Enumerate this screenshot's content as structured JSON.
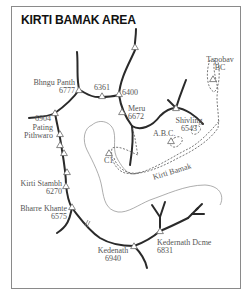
{
  "map": {
    "title": "KIRTI BAMAK AREA",
    "colors": {
      "ridge": "#2a2a2a",
      "glacier": "#808080",
      "trail": "#555555",
      "label": "#555555",
      "border": "#8a8a8a"
    },
    "peaks": [
      {
        "name": "Bhngu Panth",
        "elevation": "6777"
      },
      {
        "name": "",
        "elevation": "6361"
      },
      {
        "name": "",
        "elevation": "6400"
      },
      {
        "name": "Meru",
        "elevation": "6672"
      },
      {
        "name": "",
        "elevation": "6904"
      },
      {
        "name": "Pating Pithwaro",
        "line1": "Pating",
        "line2": "Pithwaro"
      },
      {
        "name": "Shivling",
        "elevation": "6543"
      },
      {
        "name": "Kirti Stambh",
        "elevation": "6270"
      },
      {
        "name": "Bharre Khante",
        "elevation": "6575"
      },
      {
        "name": "Kedenath",
        "elevation": "6940"
      },
      {
        "name": "Kedernath Dcme",
        "elevation": "6831"
      }
    ],
    "camps": [
      {
        "name": "Tapobav",
        "line2": "BC"
      },
      {
        "name": "A.B.C."
      },
      {
        "name": "C1"
      }
    ],
    "glacier": {
      "name": "Kirti Bamak"
    }
  }
}
